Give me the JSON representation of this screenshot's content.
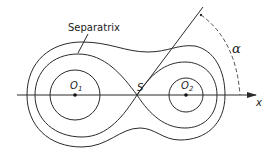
{
  "diagram": {
    "type": "phase-portrait-separatrix",
    "labels": {
      "separatrix": "Separatrix",
      "saddle_point": "S",
      "focus_1": "O",
      "focus_1_sub": "1",
      "focus_2": "O",
      "focus_2_sub": "2",
      "x_axis": "x",
      "angle": "α"
    },
    "elements": [
      {
        "name": "x-axis",
        "kind": "arrow-line",
        "from": [
          17,
          95
        ],
        "to": [
          255,
          95
        ]
      },
      {
        "name": "focus-1",
        "kind": "point",
        "at": [
          75,
          95
        ]
      },
      {
        "name": "focus-2",
        "kind": "point",
        "at": [
          186,
          95
        ]
      },
      {
        "name": "saddle-point",
        "kind": "point",
        "at": [
          137,
          95
        ]
      },
      {
        "name": "inner-orbit-1",
        "kind": "circle",
        "center": [
          75,
          95
        ],
        "radius": 25
      },
      {
        "name": "inner-orbit-2",
        "kind": "circle",
        "center": [
          186,
          95
        ],
        "radius": 17
      },
      {
        "name": "separatrix",
        "kind": "figure-eight",
        "through": [
          137,
          95
        ]
      },
      {
        "name": "outer-orbit",
        "kind": "closed-curve",
        "encloses": [
          "focus-1",
          "focus-2"
        ]
      },
      {
        "name": "ray",
        "kind": "line",
        "from": [
          137,
          95
        ],
        "to": [
          203,
          7
        ]
      },
      {
        "name": "angle-arc",
        "kind": "dashed-arc",
        "from": [
          201,
          15
        ],
        "to": [
          240,
          95
        ]
      }
    ],
    "colors": {
      "stroke": "#2a2a2a",
      "background": "#ffffff"
    }
  }
}
